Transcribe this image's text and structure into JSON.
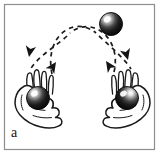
{
  "figure": {
    "panel_label": "a",
    "caption_text": "a",
    "border_color": "#8d8d8d",
    "background_color": "#ffffff",
    "ink_color": "#1a1a1a",
    "ball_color": "#141414",
    "ball_highlight_color": "#ffffff",
    "frame": {
      "x": 4,
      "y": 4,
      "width": 151,
      "height": 146
    }
  },
  "objects": {
    "balls": [
      {
        "name": "airborne-ball",
        "cx": 111,
        "cy": 24,
        "r": 11.5,
        "state": "in-flight",
        "label": "ball in flight"
      },
      {
        "name": "left-hand-ball",
        "cx": 38,
        "cy": 98,
        "r": 11.5,
        "state": "held",
        "label": "ball in left hand"
      },
      {
        "name": "right-hand-ball",
        "cx": 127,
        "cy": 98,
        "r": 11.5,
        "state": "held",
        "label": "ball in right hand"
      }
    ],
    "hands": [
      {
        "name": "left-hand",
        "side": "left",
        "pose": "palm-up-holding-ball"
      },
      {
        "name": "right-hand",
        "side": "right",
        "pose": "palm-up-holding-ball"
      }
    ]
  },
  "trajectories": [
    {
      "name": "left-to-right-arc",
      "style": "dashed",
      "description": "arc rising from the left hand, crossing the centre, descending toward the right hand",
      "path": "M 52 74 C 44 34, 74 16, 96 34 C 112 47, 124 58, 132 70",
      "arrowheads": [
        {
          "name": "ascend-arrow-left",
          "x": 56,
          "y": 62,
          "angle": -58
        },
        {
          "name": "descend-arrow-right",
          "x": 127,
          "y": 62,
          "angle": 62
        }
      ]
    },
    {
      "name": "right-to-left-arc",
      "style": "dashed",
      "description": "arc rising from the right hand, crossing the centre, descending toward the left hand",
      "path": "M 113 74 C 121 34, 91 16, 69 34 C 53 47, 37 56, 29 70",
      "arrowheads": [
        {
          "name": "ascend-arrow-right",
          "x": 107,
          "y": 62,
          "angle": -122
        },
        {
          "name": "descend-arrow-left",
          "x": 29,
          "y": 57,
          "angle": 96
        }
      ]
    }
  ],
  "annotations": {
    "cross_point": {
      "x": 73,
      "y": 38,
      "label": "paths cross"
    },
    "dash_pattern": "4 4",
    "stroke_width": 1.6
  }
}
